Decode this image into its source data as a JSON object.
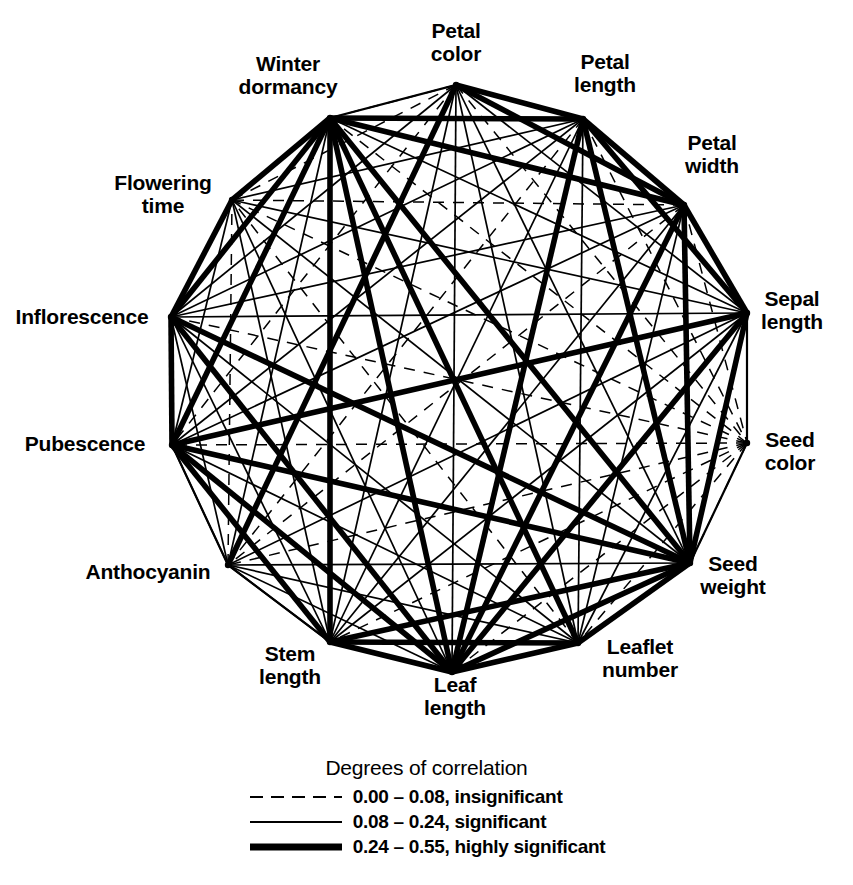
{
  "figure": {
    "type": "correlation-network",
    "background": "#ffffff",
    "line_color": "#000000"
  },
  "nodes": [
    {
      "id": "petal_color",
      "label": "Petal\ncolor",
      "angle_deg": 90,
      "x": 456,
      "y": 85,
      "label_x": 456,
      "label_y": 43
    },
    {
      "id": "petal_length",
      "label": "Petal\nlength",
      "angle_deg": 66,
      "x": 583,
      "y": 119,
      "label_x": 605,
      "label_y": 74
    },
    {
      "id": "petal_width",
      "label": "Petal\nwidth",
      "angle_deg": 42,
      "x": 684,
      "y": 205,
      "label_x": 712,
      "label_y": 155
    },
    {
      "id": "sepal_length",
      "label": "Sepal\nlength",
      "angle_deg": 18,
      "x": 747,
      "y": 313,
      "label_x": 792,
      "label_y": 311
    },
    {
      "id": "seed_color",
      "label": "Seed\ncolor",
      "angle_deg": -6,
      "x": 747,
      "y": 443,
      "label_x": 790,
      "label_y": 452
    },
    {
      "id": "seed_weight",
      "label": "Seed\nweight",
      "angle_deg": -30,
      "x": 690,
      "y": 563,
      "label_x": 733,
      "label_y": 576
    },
    {
      "id": "leaflet_number",
      "label": "Leaflet\nnumber",
      "angle_deg": -54,
      "x": 578,
      "y": 643,
      "label_x": 640,
      "label_y": 659
    },
    {
      "id": "leaf_length",
      "label": "Leaf\nlength",
      "angle_deg": -78,
      "x": 452,
      "y": 672,
      "label_x": 455,
      "label_y": 697
    },
    {
      "id": "stem_length",
      "label": "Stem\nlength",
      "angle_deg": -102,
      "x": 330,
      "y": 642,
      "label_x": 290,
      "label_y": 666
    },
    {
      "id": "anthocyanin",
      "label": "Anthocyanin",
      "angle_deg": -126,
      "x": 228,
      "y": 565,
      "label_x": 148,
      "label_y": 572
    },
    {
      "id": "pubescence",
      "label": "Pubescence",
      "angle_deg": -150,
      "x": 172,
      "y": 445,
      "label_x": 85,
      "label_y": 444
    },
    {
      "id": "inflorescence",
      "label": "Inflorescence",
      "angle_deg": 174,
      "x": 171,
      "y": 317,
      "label_x": 82,
      "label_y": 317
    },
    {
      "id": "flowering_time",
      "label": "Flowering\ntime",
      "angle_deg": 150,
      "x": 232,
      "y": 200,
      "label_x": 163,
      "label_y": 195
    },
    {
      "id": "winter_dormancy",
      "label": "Winter\ndormancy",
      "angle_deg": 126,
      "x": 330,
      "y": 118,
      "label_x": 288,
      "label_y": 76
    }
  ],
  "legend": {
    "title": "Degrees of correlation",
    "entries": [
      {
        "style": "dashed",
        "label": "0.00 – 0.08, insignificant",
        "width": 2.0
      },
      {
        "style": "thin",
        "label": "0.08 – 0.24, significant",
        "width": 2.2
      },
      {
        "style": "thick",
        "label": "0.24 – 0.55, highly significant",
        "width": 7.0
      }
    ]
  },
  "chart_data": {
    "type": "network",
    "title": "Degrees of correlation",
    "node_count": 15,
    "layout": "regular-polygon",
    "center": [
      459,
      380
    ],
    "radius": 291,
    "node_labels": [
      "Petal color",
      "Petal length",
      "Petal width",
      "Sepal length",
      "Seed color",
      "Seed weight",
      "Leaflet number",
      "Leaf length",
      "Stem length",
      "Anthocyanin",
      "Pubescence",
      "Inflorescence",
      "Flowering time",
      "Winter dormancy",
      "Seed color 2"
    ],
    "edge_classes": [
      {
        "name": "insignificant",
        "range": [
          0.0,
          0.08
        ],
        "style": "dashed",
        "stroke_width": 1.3
      },
      {
        "name": "significant",
        "range": [
          0.08,
          0.24
        ],
        "style": "solid",
        "stroke_width": 1.6
      },
      {
        "name": "highly significant",
        "range": [
          0.24,
          0.55
        ],
        "style": "solid",
        "stroke_width": 5.0
      }
    ],
    "edges": [
      [
        "petal_color",
        "petal_length",
        "thick"
      ],
      [
        "petal_color",
        "petal_width",
        "thick"
      ],
      [
        "petal_color",
        "sepal_length",
        "thin"
      ],
      [
        "petal_color",
        "seed_color",
        "dashed"
      ],
      [
        "petal_color",
        "seed_weight",
        "thin"
      ],
      [
        "petal_color",
        "leaflet_number",
        "thin"
      ],
      [
        "petal_color",
        "leaf_length",
        "thin"
      ],
      [
        "petal_color",
        "stem_length",
        "thin"
      ],
      [
        "petal_color",
        "anthocyanin",
        "thick"
      ],
      [
        "petal_color",
        "pubescence",
        "dashed"
      ],
      [
        "petal_color",
        "inflorescence",
        "thin"
      ],
      [
        "petal_color",
        "flowering_time",
        "dashed"
      ],
      [
        "petal_color",
        "winter_dormancy",
        "dashed"
      ],
      [
        "petal_length",
        "petal_width",
        "thick"
      ],
      [
        "petal_length",
        "sepal_length",
        "thick"
      ],
      [
        "petal_length",
        "seed_color",
        "dashed"
      ],
      [
        "petal_length",
        "seed_weight",
        "thick"
      ],
      [
        "petal_length",
        "leaflet_number",
        "thin"
      ],
      [
        "petal_length",
        "leaf_length",
        "thick"
      ],
      [
        "petal_length",
        "stem_length",
        "thin"
      ],
      [
        "petal_length",
        "anthocyanin",
        "dashed"
      ],
      [
        "petal_length",
        "pubescence",
        "thin"
      ],
      [
        "petal_length",
        "inflorescence",
        "thin"
      ],
      [
        "petal_length",
        "flowering_time",
        "thin"
      ],
      [
        "petal_length",
        "winter_dormancy",
        "thick"
      ],
      [
        "petal_width",
        "sepal_length",
        "thick"
      ],
      [
        "petal_width",
        "seed_color",
        "dashed"
      ],
      [
        "petal_width",
        "seed_weight",
        "thick"
      ],
      [
        "petal_width",
        "leaflet_number",
        "thin"
      ],
      [
        "petal_width",
        "leaf_length",
        "thick"
      ],
      [
        "petal_width",
        "stem_length",
        "thin"
      ],
      [
        "petal_width",
        "anthocyanin",
        "dashed"
      ],
      [
        "petal_width",
        "pubescence",
        "thin"
      ],
      [
        "petal_width",
        "inflorescence",
        "thin"
      ],
      [
        "petal_width",
        "flowering_time",
        "dashed"
      ],
      [
        "petal_width",
        "winter_dormancy",
        "thick"
      ],
      [
        "sepal_length",
        "seed_color",
        "dashed"
      ],
      [
        "sepal_length",
        "seed_weight",
        "thick"
      ],
      [
        "sepal_length",
        "leaflet_number",
        "thin"
      ],
      [
        "sepal_length",
        "leaf_length",
        "thick"
      ],
      [
        "sepal_length",
        "stem_length",
        "thin"
      ],
      [
        "sepal_length",
        "anthocyanin",
        "thin"
      ],
      [
        "sepal_length",
        "pubescence",
        "thick"
      ],
      [
        "sepal_length",
        "inflorescence",
        "thin"
      ],
      [
        "sepal_length",
        "flowering_time",
        "thin"
      ],
      [
        "sepal_length",
        "winter_dormancy",
        "thin"
      ],
      [
        "seed_color",
        "seed_weight",
        "dashed"
      ],
      [
        "seed_color",
        "leaflet_number",
        "dashed"
      ],
      [
        "seed_color",
        "leaf_length",
        "dashed"
      ],
      [
        "seed_color",
        "stem_length",
        "dashed"
      ],
      [
        "seed_color",
        "anthocyanin",
        "dashed"
      ],
      [
        "seed_color",
        "pubescence",
        "dashed"
      ],
      [
        "seed_color",
        "inflorescence",
        "dashed"
      ],
      [
        "seed_color",
        "flowering_time",
        "dashed"
      ],
      [
        "seed_color",
        "winter_dormancy",
        "dashed"
      ],
      [
        "seed_weight",
        "leaflet_number",
        "thick"
      ],
      [
        "seed_weight",
        "leaf_length",
        "thick"
      ],
      [
        "seed_weight",
        "stem_length",
        "thick"
      ],
      [
        "seed_weight",
        "anthocyanin",
        "thin"
      ],
      [
        "seed_weight",
        "pubescence",
        "thick"
      ],
      [
        "seed_weight",
        "inflorescence",
        "thick"
      ],
      [
        "seed_weight",
        "flowering_time",
        "thin"
      ],
      [
        "seed_weight",
        "winter_dormancy",
        "thick"
      ],
      [
        "leaflet_number",
        "leaf_length",
        "thick"
      ],
      [
        "leaflet_number",
        "stem_length",
        "thick"
      ],
      [
        "leaflet_number",
        "anthocyanin",
        "thin"
      ],
      [
        "leaflet_number",
        "pubescence",
        "thin"
      ],
      [
        "leaflet_number",
        "inflorescence",
        "thin"
      ],
      [
        "leaflet_number",
        "flowering_time",
        "dashed"
      ],
      [
        "leaflet_number",
        "winter_dormancy",
        "thick"
      ],
      [
        "leaf_length",
        "stem_length",
        "thick"
      ],
      [
        "leaf_length",
        "anthocyanin",
        "thin"
      ],
      [
        "leaf_length",
        "pubescence",
        "thick"
      ],
      [
        "leaf_length",
        "inflorescence",
        "thick"
      ],
      [
        "leaf_length",
        "flowering_time",
        "thin"
      ],
      [
        "leaf_length",
        "winter_dormancy",
        "thick"
      ],
      [
        "stem_length",
        "anthocyanin",
        "thin"
      ],
      [
        "stem_length",
        "pubescence",
        "thick"
      ],
      [
        "stem_length",
        "inflorescence",
        "thin"
      ],
      [
        "stem_length",
        "flowering_time",
        "thin"
      ],
      [
        "stem_length",
        "winter_dormancy",
        "thick"
      ],
      [
        "anthocyanin",
        "pubescence",
        "thin"
      ],
      [
        "anthocyanin",
        "inflorescence",
        "thin"
      ],
      [
        "anthocyanin",
        "flowering_time",
        "dashed"
      ],
      [
        "anthocyanin",
        "winter_dormancy",
        "thin"
      ],
      [
        "pubescence",
        "inflorescence",
        "thick"
      ],
      [
        "pubescence",
        "flowering_time",
        "thin"
      ],
      [
        "pubescence",
        "winter_dormancy",
        "thick"
      ],
      [
        "inflorescence",
        "flowering_time",
        "thick"
      ],
      [
        "inflorescence",
        "winter_dormancy",
        "thick"
      ],
      [
        "flowering_time",
        "winter_dormancy",
        "thick"
      ]
    ]
  }
}
